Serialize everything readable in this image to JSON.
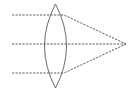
{
  "diagram": {
    "type": "optics-convex-lens",
    "colors": {
      "background": "#ffffff",
      "lens_stroke": "#5a5a5a",
      "ray_stroke": "#4a4a4a"
    },
    "lens": {
      "cx": 55.5,
      "top": 4,
      "bottom": 88,
      "half_width": 11
    },
    "focal_point": {
      "x": 126,
      "y": 44
    },
    "rays": [
      {
        "name": "top",
        "start_x": 12,
        "y": 15,
        "bend_x": 64
      },
      {
        "name": "middle",
        "start_x": 12,
        "y": 44,
        "bend_x": 64
      },
      {
        "name": "bottom",
        "start_x": 12,
        "y": 73,
        "bend_x": 64
      }
    ]
  }
}
